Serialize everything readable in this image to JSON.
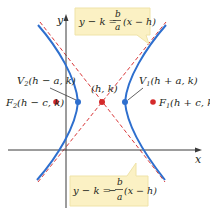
{
  "diagram": {
    "type": "hyperbola-horizontal-transverse",
    "axes": {
      "x_label": "x",
      "y_label": "y"
    },
    "center": {
      "label": "(h, k)"
    },
    "vertices": [
      {
        "name": "V1",
        "label_main": "V",
        "label_sub": "1",
        "label_rest": "(h + a, k)"
      },
      {
        "name": "V2",
        "label_main": "V",
        "label_sub": "2",
        "label_rest": "(h − a, k)"
      }
    ],
    "foci": [
      {
        "name": "F1",
        "label_main": "F",
        "label_sub": "1",
        "label_rest": "(h + c, k)"
      },
      {
        "name": "F2",
        "label_main": "F",
        "label_sub": "2",
        "label_rest": "(h − c, k)"
      }
    ],
    "asymptotes": [
      {
        "lhs": "y − k =",
        "sign": "",
        "num": "b",
        "den": "a",
        "rhs": "(x − h)"
      },
      {
        "lhs": "y − k =",
        "sign": "−",
        "num": "b",
        "den": "a",
        "rhs": "(x − h)"
      }
    ],
    "colors": {
      "curve": "#2e6fce",
      "asymptote": "#d9383a",
      "focus": "#d42a2a",
      "vertex": "#2e6fce",
      "axis": "#3a3a3a",
      "callout_bg": "#fbf1c4",
      "callout_border": "#efe3a8",
      "text": "#231f20"
    }
  }
}
